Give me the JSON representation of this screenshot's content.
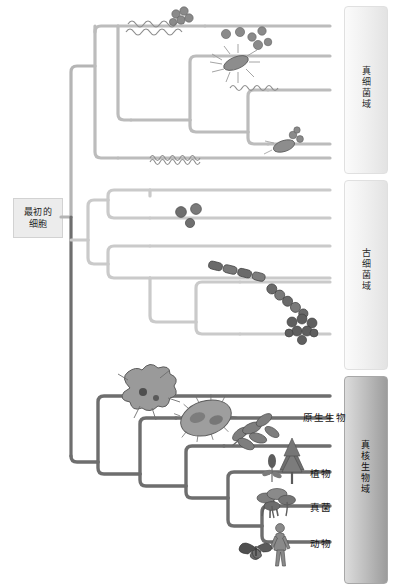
{
  "diagram": {
    "title": "",
    "root": {
      "line1": "最初的",
      "line2": "细胞"
    },
    "colors": {
      "eubacteria_branch": "#b8b8b8",
      "archaea_branch": "#c9c9c9",
      "eukaryote_branch": "#6e6e6e",
      "bracket_light": "#eeeeee",
      "bracket_dark": "#bdbdbd",
      "label_text": "#1c1c1c",
      "root_box": "#ececec"
    },
    "domains": [
      {
        "id": "eubacteria",
        "label": "真细菌域",
        "style": "light"
      },
      {
        "id": "archaea",
        "label": "古细菌域",
        "style": "light"
      },
      {
        "id": "eukaryota",
        "label": "真核生物域",
        "style": "dark"
      }
    ],
    "leaf_labels": [
      {
        "id": "protists",
        "label": "原生生物"
      },
      {
        "id": "plants",
        "label": "植物"
      },
      {
        "id": "fungi",
        "label": "真菌"
      },
      {
        "id": "animals",
        "label": "动物"
      }
    ],
    "organisms": [
      {
        "id": "spirochete-top",
        "kind": "spirochete",
        "domain": "eubacteria"
      },
      {
        "id": "cocci-cluster-top",
        "kind": "cocci-cluster",
        "domain": "eubacteria"
      },
      {
        "id": "cocci-scatter",
        "kind": "cocci-scatter",
        "domain": "eubacteria"
      },
      {
        "id": "flagellated-bacillus",
        "kind": "bacillus",
        "domain": "eubacteria"
      },
      {
        "id": "wavy-filament",
        "kind": "spirochete",
        "domain": "eubacteria"
      },
      {
        "id": "bacillus-lower",
        "kind": "bacillus",
        "domain": "eubacteria"
      },
      {
        "id": "spiral-filament",
        "kind": "spirochete",
        "domain": "eubacteria"
      },
      {
        "id": "archaeal-cocci",
        "kind": "cocci-scatter",
        "domain": "archaea"
      },
      {
        "id": "archaeal-rod-chain",
        "kind": "rod-chain",
        "domain": "archaea"
      },
      {
        "id": "archaeal-chain",
        "kind": "rod-chain",
        "domain": "archaea"
      },
      {
        "id": "archaeal-cluster",
        "kind": "cluster",
        "domain": "archaea"
      },
      {
        "id": "amoeba",
        "kind": "amoeba",
        "domain": "eukaryota"
      },
      {
        "id": "paramecium",
        "kind": "paramecium",
        "domain": "eukaryota"
      },
      {
        "id": "algae-branch",
        "kind": "plant-sprig",
        "domain": "eukaryota"
      },
      {
        "id": "tree-and-flower",
        "kind": "tree",
        "domain": "eukaryota"
      },
      {
        "id": "mushrooms",
        "kind": "mushrooms",
        "domain": "eukaryota"
      },
      {
        "id": "human-and-butterfly",
        "kind": "animals",
        "domain": "eukaryota"
      }
    ]
  }
}
